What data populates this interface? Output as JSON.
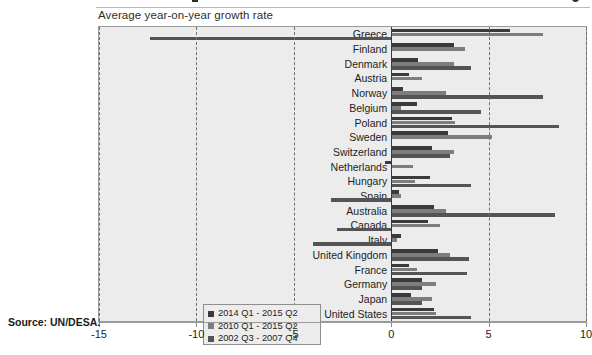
{
  "subtitle": "Average year-on-year growth rate",
  "source": "Source: UN/DESA.",
  "legend": {
    "items": [
      {
        "label": "2014 Q1 - 2015 Q2",
        "color": "#3a3a3a"
      },
      {
        "label": "2010 Q1 - 2015 Q2",
        "color": "#7d7d7d"
      },
      {
        "label": "2002 Q3 - 2007 Q4",
        "color": "#545454"
      }
    ]
  },
  "chart_data": {
    "type": "bar",
    "orientation": "horizontal",
    "title": "Average year-on-year growth rate",
    "xlabel": "",
    "ylabel": "",
    "xlim": [
      -15,
      10
    ],
    "xticks": [
      -15,
      -10,
      -5,
      0,
      5,
      10
    ],
    "xticklabels": [
      "-15",
      "-10",
      "-5",
      "0",
      "5",
      "10"
    ],
    "grid": "vertical-dashed",
    "legend_position": "bottom-left",
    "categories": [
      "Greece",
      "Finland",
      "Denmark",
      "Austria",
      "Norway",
      "Belgium",
      "Poland",
      "Sweden",
      "Switzerland",
      "Netherlands",
      "Hungary",
      "Spain",
      "Australia",
      "Canada",
      "Italy",
      "United Kingdom",
      "France",
      "Germany",
      "Japan",
      "United States"
    ],
    "series": [
      {
        "name": "2014 Q1 - 2015 Q2",
        "color": "#3a3a3a",
        "values": [
          6.1,
          3.2,
          1.4,
          0.9,
          0.6,
          1.3,
          3.1,
          2.9,
          2.1,
          -0.3,
          2.0,
          0.4,
          2.2,
          1.9,
          0.5,
          2.4,
          0.9,
          1.6,
          1.0,
          2.2
        ]
      },
      {
        "name": "2010 Q1 - 2015 Q2",
        "color": "#7d7d7d",
        "values": [
          7.8,
          3.8,
          3.2,
          1.6,
          2.8,
          0.5,
          3.3,
          5.2,
          3.2,
          1.1,
          1.2,
          0.5,
          2.8,
          2.5,
          0.3,
          3.0,
          1.3,
          2.3,
          2.1,
          2.3
        ]
      },
      {
        "name": "2002 Q3 - 2007 Q4",
        "color": "#545454",
        "values": [
          -12.4,
          0.0,
          4.1,
          0.0,
          7.8,
          4.6,
          8.6,
          0.0,
          3.0,
          0.0,
          4.1,
          -3.1,
          8.4,
          -2.8,
          -4.0,
          4.0,
          3.9,
          1.6,
          1.6,
          4.1
        ]
      }
    ]
  }
}
